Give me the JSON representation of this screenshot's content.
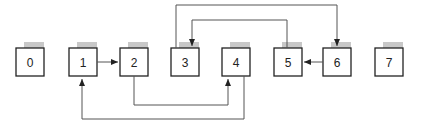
{
  "nodes": [
    {
      "id": "0",
      "x": 16,
      "label": "0"
    },
    {
      "id": "1",
      "x": 69,
      "label": "1"
    },
    {
      "id": "2",
      "x": 120,
      "label": "2"
    },
    {
      "id": "3",
      "x": 171,
      "label": "3"
    },
    {
      "id": "4",
      "x": 222,
      "label": "4"
    },
    {
      "id": "5",
      "x": 274,
      "label": "5"
    },
    {
      "id": "6",
      "x": 323,
      "label": "6"
    },
    {
      "id": "7",
      "x": 375,
      "label": "7"
    }
  ],
  "edges": [
    {
      "from": "1",
      "to": "2"
    },
    {
      "from": "6",
      "to": "5"
    },
    {
      "from": "3",
      "to": "6"
    },
    {
      "from": "5",
      "to": "3"
    },
    {
      "from": "2",
      "to": "4"
    },
    {
      "from": "4",
      "to": "1"
    }
  ],
  "colors": {
    "stroke": "#222222",
    "shadow": "#c8c8c8",
    "line": "#555555"
  }
}
